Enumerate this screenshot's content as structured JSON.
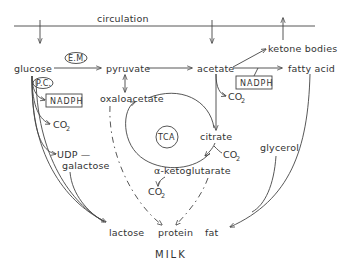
{
  "header_label": "circulation",
  "footer_label": "MILK",
  "nodes": {
    "glucose": "glucose",
    "pyruvate": "pyruvate",
    "acetate": "acetate",
    "ketone_bodies": "ketone bodies",
    "fatty_acid": "fatty acid",
    "oxaloacetate": "oxaloacetate",
    "citrate": "citrate",
    "alpha_ketoglutarate": "α-ketoglutarate",
    "tca": "TCA",
    "udp": "UDP —",
    "galactose": "galactose",
    "glycerol": "glycerol",
    "lactose": "lactose",
    "protein": "protein",
    "fat": "fat"
  },
  "cofactors": {
    "em": "E.M.",
    "pc": "P.C.",
    "nadph_left": "NADPH",
    "nadph_right": "NADPH",
    "co2_glucose": "CO",
    "co2_acetate": "CO",
    "co2_citrate": "CO",
    "co2_akg": "CO",
    "sub2": "2"
  }
}
